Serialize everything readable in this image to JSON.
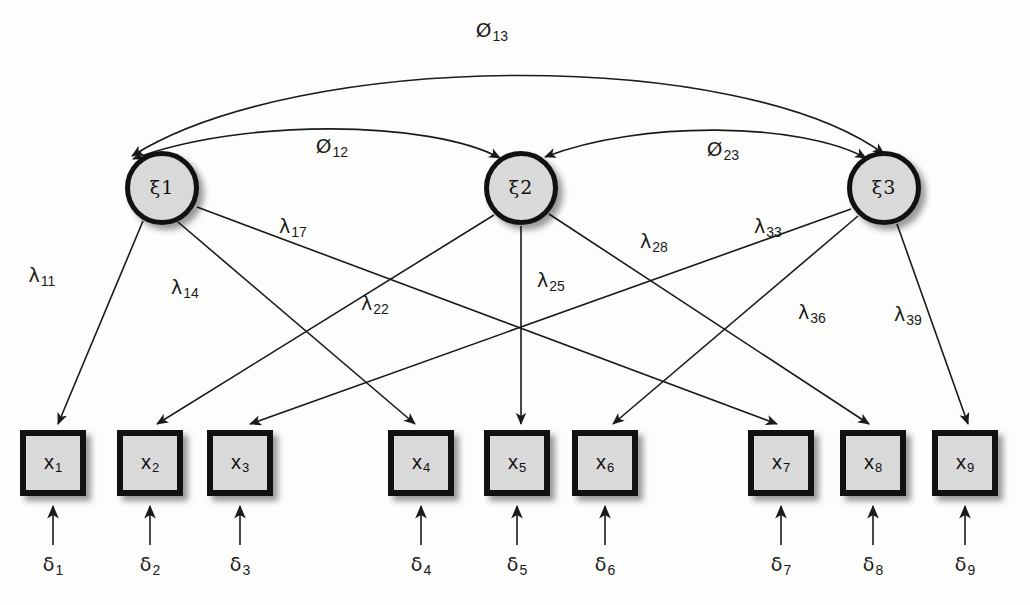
{
  "diagram": {
    "type": "sem-path-diagram"
  },
  "latents": [
    {
      "id": "xi1",
      "symbol": "ξ",
      "index": "1",
      "cx": 162,
      "cy": 188
    },
    {
      "id": "xi2",
      "symbol": "ξ",
      "index": "2",
      "cx": 521,
      "cy": 188
    },
    {
      "id": "xi3",
      "symbol": "ξ",
      "index": "3",
      "cx": 884,
      "cy": 188
    }
  ],
  "observed": [
    {
      "id": "x1",
      "symbol": "x",
      "index": "1",
      "x": 20,
      "y": 430
    },
    {
      "id": "x2",
      "symbol": "x",
      "index": "2",
      "x": 117,
      "y": 430
    },
    {
      "id": "x3",
      "symbol": "x",
      "index": "3",
      "x": 207,
      "y": 430
    },
    {
      "id": "x4",
      "symbol": "x",
      "index": "4",
      "x": 388,
      "y": 430
    },
    {
      "id": "x5",
      "symbol": "x",
      "index": "5",
      "x": 484,
      "y": 430
    },
    {
      "id": "x6",
      "symbol": "x",
      "index": "6",
      "x": 572,
      "y": 430
    },
    {
      "id": "x7",
      "symbol": "x",
      "index": "7",
      "x": 748,
      "y": 430
    },
    {
      "id": "x8",
      "symbol": "x",
      "index": "8",
      "x": 840,
      "y": 430
    },
    {
      "id": "x9",
      "symbol": "x",
      "index": "9",
      "x": 932,
      "y": 430
    }
  ],
  "errors": [
    {
      "id": "d1",
      "symbol": "δ",
      "index": "1",
      "x": 53,
      "y": 566
    },
    {
      "id": "d2",
      "symbol": "δ",
      "index": "2",
      "x": 150,
      "y": 566
    },
    {
      "id": "d3",
      "symbol": "δ",
      "index": "3",
      "x": 240,
      "y": 566
    },
    {
      "id": "d4",
      "symbol": "δ",
      "index": "4",
      "x": 421,
      "y": 566
    },
    {
      "id": "d5",
      "symbol": "δ",
      "index": "5",
      "x": 517,
      "y": 566
    },
    {
      "id": "d6",
      "symbol": "δ",
      "index": "6",
      "x": 605,
      "y": 566
    },
    {
      "id": "d7",
      "symbol": "δ",
      "index": "7",
      "x": 781,
      "y": 566
    },
    {
      "id": "d8",
      "symbol": "δ",
      "index": "8",
      "x": 873,
      "y": 566
    },
    {
      "id": "d9",
      "symbol": "δ",
      "index": "9",
      "x": 965,
      "y": 566
    }
  ],
  "loadings": [
    {
      "id": "l11",
      "symbol": "λ",
      "index": "11",
      "from": "xi1",
      "to": "x1",
      "x": 42,
      "y": 277
    },
    {
      "id": "l14",
      "symbol": "λ",
      "index": "14",
      "from": "xi1",
      "to": "x4",
      "x": 185,
      "y": 289
    },
    {
      "id": "l17",
      "symbol": "λ",
      "index": "17",
      "from": "xi1",
      "to": "x7",
      "x": 293,
      "y": 228
    },
    {
      "id": "l22",
      "symbol": "λ",
      "index": "22",
      "from": "xi2",
      "to": "x2",
      "x": 375,
      "y": 305
    },
    {
      "id": "l25",
      "symbol": "λ",
      "index": "25",
      "from": "xi2",
      "to": "x5",
      "x": 551,
      "y": 282
    },
    {
      "id": "l28",
      "symbol": "λ",
      "index": "28",
      "from": "xi2",
      "to": "x8",
      "x": 654,
      "y": 243
    },
    {
      "id": "l33",
      "symbol": "λ",
      "index": "33",
      "from": "xi3",
      "to": "x3",
      "x": 768,
      "y": 228
    },
    {
      "id": "l36",
      "symbol": "λ",
      "index": "36",
      "from": "xi3",
      "to": "x6",
      "x": 812,
      "y": 314
    },
    {
      "id": "l39",
      "symbol": "λ",
      "index": "39",
      "from": "xi3",
      "to": "x9",
      "x": 908,
      "y": 316
    }
  ],
  "correlations": [
    {
      "id": "p12",
      "symbol": "Ø",
      "index": "12",
      "from": "xi1",
      "to": "xi2",
      "x": 332,
      "y": 147
    },
    {
      "id": "p13",
      "symbol": "Ø",
      "index": "13",
      "from": "xi1",
      "to": "xi3",
      "x": 492,
      "y": 31
    },
    {
      "id": "p23",
      "symbol": "Ø",
      "index": "23",
      "from": "xi2",
      "to": "xi3",
      "x": 723,
      "y": 150
    }
  ],
  "colors": {
    "node_fill": "#d9d9d9",
    "node_stroke": "#111111",
    "line": "#1a1a1a",
    "background": "#fdfdfc"
  }
}
